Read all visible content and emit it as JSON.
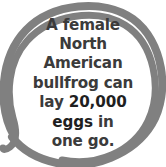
{
  "card": {
    "type": "fun-fact-graphic",
    "background_color": "#ffffff",
    "ring_color": "#808080",
    "text_color": "#3b3b3b",
    "emphasis_color": "#1f1f1f",
    "ring_style": "hand-drawn-double-circle"
  },
  "fact": {
    "full_text": "A female North American bullfrog can lay 20,000 eggs in one go.",
    "lines": [
      {
        "id": "line-1",
        "segments": [
          {
            "text": "A female",
            "emphasis": false
          }
        ]
      },
      {
        "id": "line-2",
        "segments": [
          {
            "text": "North",
            "emphasis": false
          }
        ]
      },
      {
        "id": "line-3",
        "segments": [
          {
            "text": "American",
            "emphasis": false
          }
        ]
      },
      {
        "id": "line-4",
        "segments": [
          {
            "text": "bullfrog can",
            "emphasis": false
          }
        ]
      },
      {
        "id": "line-5",
        "segments": [
          {
            "text": "lay ",
            "emphasis": false
          },
          {
            "text": "20,000",
            "emphasis": true
          }
        ]
      },
      {
        "id": "line-6",
        "segments": [
          {
            "text": "eggs",
            "emphasis": true
          },
          {
            "text": " in",
            "emphasis": false
          }
        ]
      },
      {
        "id": "line-7",
        "segments": [
          {
            "text": "one go.",
            "emphasis": false
          }
        ]
      }
    ],
    "line_1": "A female",
    "line_2": "North",
    "line_3": "American",
    "line_4": "bullfrog can",
    "line_5_prefix": "lay ",
    "line_5_emphasis": "20,000",
    "line_6_emphasis": "eggs",
    "line_6_suffix": " in",
    "line_7": "one go.",
    "highlighted_value": "20,000",
    "highlighted_unit": "eggs"
  }
}
